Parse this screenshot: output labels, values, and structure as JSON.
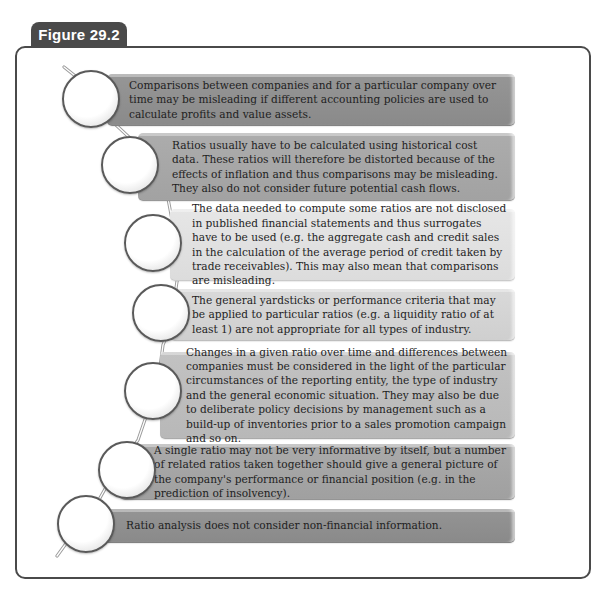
{
  "figure": {
    "label": "Figure 29.2"
  },
  "colors": {
    "tab_background": "#4a4a4a",
    "frame_border": "#4a4a4a",
    "bar_1": "#8e8e8e",
    "bar_2": "#a6a6a6",
    "bar_3": "#e0e0e0",
    "bar_4": "#d4d4d4",
    "bar_5": "#bdbdbd",
    "bar_6": "#a4a4a4",
    "bar_7": "#8e8e8e"
  },
  "items": [
    {
      "index": 1,
      "text": "Comparisons between companies and for a particular company over time may be misleading if different accounting policies are used to calculate profits and value assets."
    },
    {
      "index": 2,
      "text": "Ratios usually have to be calculated using historical cost data. These ratios will therefore be distorted because of the effects of inflation and thus comparisons may be misleading. They also do not consider future potential cash flows."
    },
    {
      "index": 3,
      "text": "The data needed to compute some ratios are not disclosed in published financial statements and thus surrogates have to be used (e.g. the aggregate cash and credit sales in the calculation of the average period of credit taken by trade receivables). This may also mean that comparisons are misleading."
    },
    {
      "index": 4,
      "text": "The general yardsticks or performance criteria that may be applied to particular ratios (e.g. a liquidity ratio of at least 1) are not appropriate for all types of industry."
    },
    {
      "index": 5,
      "text": "Changes in a given ratio over time and differences between companies must be considered in the light of the particular circumstances of the reporting entity, the type of industry and the general economic situation. They may also be due to deliberate policy decisions by management such as a build-up of inventories prior to a sales promotion campaign and so on."
    },
    {
      "index": 6,
      "text": "A single ratio may not be very informative by itself, but a number of related ratios taken together should give a general picture of the company's performance or financial position (e.g. in the prediction of insolvency)."
    },
    {
      "index": 7,
      "text": "Ratio analysis does not consider non-financial information."
    }
  ]
}
